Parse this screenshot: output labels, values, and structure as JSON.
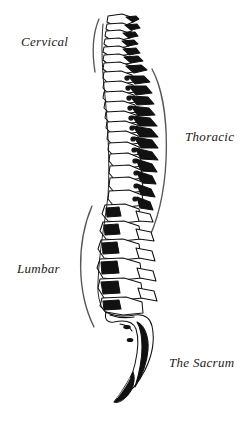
{
  "figure": {
    "background_color": "#ffffff",
    "ink_color": "#111111",
    "bracket_color": "#555555",
    "labels": [
      {
        "id": "cervical",
        "text": "Cervical",
        "side": "left",
        "bracket": "cervical-bracket"
      },
      {
        "id": "thoracic",
        "text": "Thoracic",
        "side": "right",
        "bracket": "thoracic-bracket"
      },
      {
        "id": "lumbar",
        "text": "Lumbar",
        "side": "left",
        "bracket": "lumbar-bracket"
      },
      {
        "id": "sacrum",
        "text": "The Sacrum",
        "side": "right",
        "bracket": "none"
      }
    ],
    "regions": {
      "cervical": {
        "label": "Cervical",
        "vertebra_count": 7
      },
      "thoracic": {
        "label": "Thoracic",
        "vertebra_count": 12
      },
      "lumbar": {
        "label": "Lumbar",
        "vertebra_count": 5
      },
      "sacrum": {
        "label": "The Sacrum",
        "vertebra_count": 5
      }
    }
  }
}
